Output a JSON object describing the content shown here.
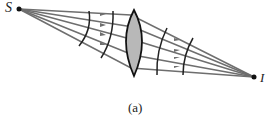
{
  "figure": {
    "source_label": "S",
    "image_label": "I",
    "caption": "(a)",
    "colors": {
      "ray": "#6e6e6e",
      "lens_fill": "#b8b8b8",
      "lens_stroke": "#111111",
      "wavefront": "#222222",
      "point": "#111111"
    },
    "elements": [
      {
        "type": "point-source",
        "label": "S"
      },
      {
        "type": "rays",
        "count": 5
      },
      {
        "type": "wavefronts-diverging",
        "count": 2
      },
      {
        "type": "converging-lens"
      },
      {
        "type": "wavefronts-converging",
        "count": 2
      },
      {
        "type": "image-point",
        "label": "I"
      }
    ]
  }
}
